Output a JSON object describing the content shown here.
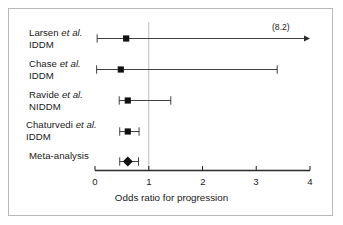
{
  "figure": {
    "type": "forest-plot",
    "background_color": "#ffffff",
    "frame_color": "#b9b9b9",
    "line_color": "#2b2b2b",
    "reference_line_color": "#bdbdbd"
  },
  "axis": {
    "title": "Odds ratio for progression",
    "ticks": [
      "0",
      "1",
      "2",
      "3",
      "4"
    ],
    "tick_values": [
      0,
      1,
      2,
      3,
      4
    ],
    "min": 0,
    "max": 4,
    "reference_line_value": 1
  },
  "rows": [
    {
      "label_line1_prefix": "Larsen ",
      "label_line1_italic": "et al.",
      "label_line2": "IDDM",
      "marker": "square",
      "point": 0.58,
      "low": 0.04,
      "high": 8.2,
      "high_clipped": true,
      "clipped_label": "(8.2)"
    },
    {
      "label_line1_prefix": "Chase ",
      "label_line1_italic": "et al.",
      "label_line2": "IDDM",
      "marker": "square",
      "point": 0.48,
      "low": 0.03,
      "high": 3.39,
      "high_clipped": false,
      "clipped_label": ""
    },
    {
      "label_line1_prefix": "Ravide ",
      "label_line1_italic": "et al.",
      "label_line2": "NIDDM",
      "marker": "square",
      "point": 0.61,
      "low": 0.45,
      "high": 1.41,
      "high_clipped": false,
      "clipped_label": ""
    },
    {
      "label_line1_prefix": "Chaturvedi ",
      "label_line1_italic": "et al.",
      "label_line2": "IDDM",
      "marker": "square",
      "point": 0.61,
      "low": 0.46,
      "high": 0.82,
      "high_clipped": false,
      "clipped_label": ""
    },
    {
      "label_line1_prefix": "Meta-analysis",
      "label_line1_italic": "",
      "label_line2": "",
      "marker": "diamond",
      "point": 0.61,
      "low": 0.46,
      "high": 0.81,
      "high_clipped": false,
      "clipped_label": ""
    }
  ],
  "chart_data": {
    "type": "forest",
    "title": "",
    "xlabel": "Odds ratio for progression",
    "ylabel": "",
    "xlim": [
      0,
      4
    ],
    "xticks": [
      0,
      1,
      2,
      3,
      4
    ],
    "xticklabels": [
      "0",
      "1",
      "2",
      "3",
      "4"
    ],
    "grid": false,
    "legend": "none",
    "reference_line": 1,
    "categories": [
      "Larsen et al. IDDM",
      "Chase et al. IDDM",
      "Ravide et al. NIDDM",
      "Chaturvedi et al. IDDM",
      "Meta-analysis"
    ],
    "values": [
      0.58,
      0.48,
      0.61,
      0.61,
      0.61
    ],
    "ci_low": [
      0.04,
      0.03,
      0.45,
      0.46,
      0.46
    ],
    "ci_high": [
      8.2,
      3.39,
      1.41,
      0.82,
      0.81
    ],
    "ci_high_truncated": [
      true,
      false,
      false,
      false,
      false
    ],
    "annotations": [
      "(8.2)"
    ],
    "marker_shapes": [
      "square",
      "square",
      "square",
      "square",
      "diamond"
    ]
  }
}
